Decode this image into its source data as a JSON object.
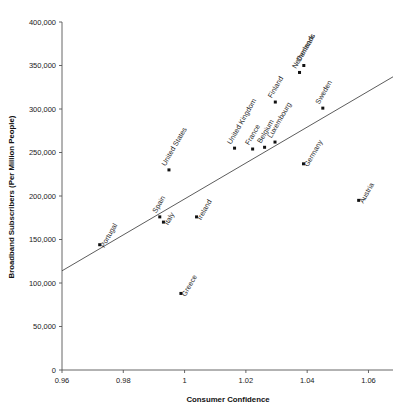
{
  "chart_data": {
    "type": "scatter",
    "title": "",
    "xlabel": "Consumer Confidence",
    "ylabel": "Broadband Subscribers (Per Million People)",
    "xlim": [
      0.96,
      1.068
    ],
    "ylim": [
      0,
      400000
    ],
    "xticks": [
      0.96,
      0.98,
      1.0,
      1.02,
      1.04,
      1.06
    ],
    "xtick_labels": [
      "0.96",
      "0.98",
      "1",
      "1.02",
      "1.04",
      "1.06"
    ],
    "yticks": [
      0,
      50000,
      100000,
      150000,
      200000,
      250000,
      300000,
      350000,
      400000
    ],
    "ytick_labels": [
      "0",
      "50,000",
      "100,000",
      "150,000",
      "200,000",
      "250,000",
      "300,000",
      "350,000",
      "400,000"
    ],
    "grid": false,
    "legend": "none",
    "marker_color": "#111111",
    "trendline": {
      "color": "#4a4a4a",
      "x_start": 0.96,
      "y_start": 114000,
      "x_end": 1.068,
      "y_end": 337000
    },
    "points": [
      {
        "label": "Portugal",
        "x": 0.9723,
        "y": 144000,
        "label_angle": -60,
        "label_side": "below-left"
      },
      {
        "label": "Spain",
        "x": 0.9919,
        "y": 176000,
        "label_angle": -60,
        "label_side": "above-left"
      },
      {
        "label": "Italy",
        "x": 0.9931,
        "y": 170000,
        "label_angle": -60,
        "label_side": "below-right"
      },
      {
        "label": "Greece",
        "x": 0.9988,
        "y": 88000,
        "label_angle": -60,
        "label_side": "below-right"
      },
      {
        "label": "United States",
        "x": 0.9949,
        "y": 230000,
        "label_angle": -60,
        "label_side": "above-left"
      },
      {
        "label": "Ireland",
        "x": 1.0039,
        "y": 176000,
        "label_angle": -60,
        "label_side": "below-right"
      },
      {
        "label": "United Kingdom",
        "x": 1.0163,
        "y": 255000,
        "label_angle": -60,
        "label_side": "above-left"
      },
      {
        "label": "France",
        "x": 1.0222,
        "y": 254000,
        "label_angle": -60,
        "label_side": "above-left"
      },
      {
        "label": "Belgium",
        "x": 1.0261,
        "y": 256000,
        "label_angle": -60,
        "label_side": "above-left"
      },
      {
        "label": "Luxembourg",
        "x": 1.0295,
        "y": 262000,
        "label_angle": -60,
        "label_side": "above-left"
      },
      {
        "label": "Finland",
        "x": 1.0296,
        "y": 308000,
        "label_angle": -60,
        "label_side": "above-left"
      },
      {
        "label": "Netherlands",
        "x": 1.0375,
        "y": 342000,
        "label_angle": -60,
        "label_side": "above-left"
      },
      {
        "label": "Denmark",
        "x": 1.0389,
        "y": 350000,
        "label_angle": -60,
        "label_side": "above-left"
      },
      {
        "label": "Germany",
        "x": 1.0388,
        "y": 237000,
        "label_angle": -60,
        "label_side": "below-right"
      },
      {
        "label": "Sweden",
        "x": 1.0451,
        "y": 301000,
        "label_angle": -60,
        "label_side": "above-left"
      },
      {
        "label": "Austria",
        "x": 1.0568,
        "y": 195000,
        "label_angle": -60,
        "label_side": "below-right"
      }
    ]
  }
}
